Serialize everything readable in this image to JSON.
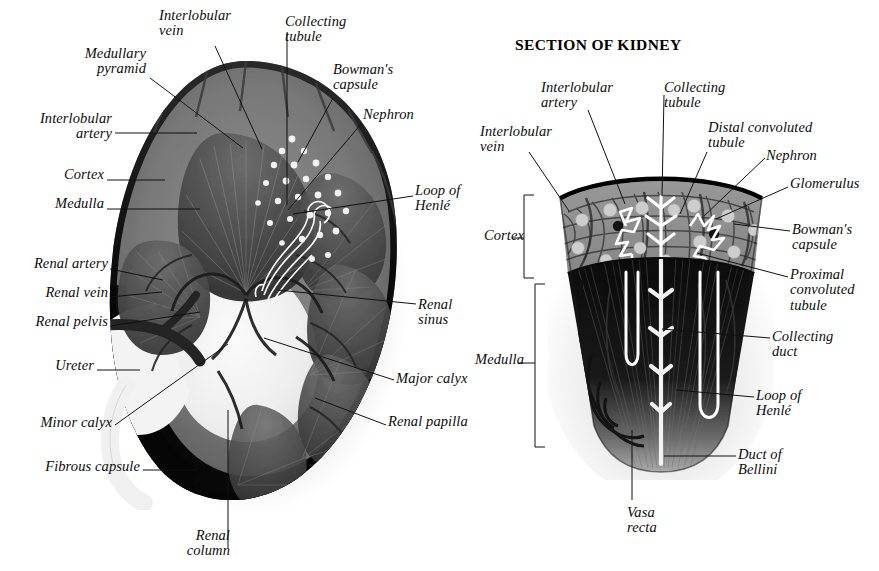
{
  "page": {
    "background": "#ffffff",
    "ink": "#0b0b0b"
  },
  "left_figure": {
    "name": "coronal-section-of-whole-kidney",
    "labels": [
      {
        "id": "medullary-pyramid",
        "text": "Medullary\npyramid",
        "align": "right"
      },
      {
        "id": "interlobular-vein",
        "text": "Interlobular\nvein",
        "align": "left"
      },
      {
        "id": "collecting-tubule",
        "text": "Collecting\ntubule",
        "align": "left"
      },
      {
        "id": "bowmans-capsule",
        "text": "Bowman's\ncapsule",
        "align": "left"
      },
      {
        "id": "interlobular-artery",
        "text": "Interlobular\nartery",
        "align": "left"
      },
      {
        "id": "nephron",
        "text": "Nephron",
        "align": "left"
      },
      {
        "id": "cortex",
        "text": "Cortex",
        "align": "right"
      },
      {
        "id": "medulla",
        "text": "Medulla",
        "align": "right"
      },
      {
        "id": "loop-of-henle",
        "text": "Loop of\nHenlé",
        "align": "left"
      },
      {
        "id": "renal-artery",
        "text": "Renal artery",
        "align": "right"
      },
      {
        "id": "renal-vein",
        "text": "Renal vein",
        "align": "right"
      },
      {
        "id": "renal-pelvis",
        "text": "Renal pelvis",
        "align": "right"
      },
      {
        "id": "renal-sinus",
        "text": "Renal\nsinus",
        "align": "left"
      },
      {
        "id": "ureter",
        "text": "Ureter",
        "align": "right"
      },
      {
        "id": "major-calyx",
        "text": "Major calyx",
        "align": "left"
      },
      {
        "id": "minor-calyx",
        "text": "Minor calyx",
        "align": "right"
      },
      {
        "id": "renal-papilla",
        "text": "Renal papilla",
        "align": "left"
      },
      {
        "id": "fibrous-capsule",
        "text": "Fibrous capsule",
        "align": "right"
      },
      {
        "id": "renal-column",
        "text": "Renal\ncolumn",
        "align": "right"
      }
    ]
  },
  "right_figure": {
    "name": "section-of-kidney-wedge-detail",
    "title": "SECTION OF KIDNEY",
    "labels": [
      {
        "id": "interlobular-artery",
        "text": "Interlobular\nartery",
        "align": "left"
      },
      {
        "id": "collecting-tubule",
        "text": "Collecting\ntubule",
        "align": "left"
      },
      {
        "id": "interlobular-vein",
        "text": "Interlobular\nvein",
        "align": "left"
      },
      {
        "id": "distal-convoluted-tubule",
        "text": "Distal convoluted\ntubule",
        "align": "left"
      },
      {
        "id": "nephron",
        "text": "Nephron",
        "align": "left"
      },
      {
        "id": "glomerulus",
        "text": "Glomerulus",
        "align": "left"
      },
      {
        "id": "bowmans-capsule",
        "text": "Bowman's\ncapsule",
        "align": "left"
      },
      {
        "id": "proximal-convoluted-tubule",
        "text": "Proximal\nconvoluted\ntubule",
        "align": "left"
      },
      {
        "id": "collecting-duct",
        "text": "Collecting\nduct",
        "align": "left"
      },
      {
        "id": "loop-of-henle",
        "text": "Loop of\nHenlé",
        "align": "left"
      },
      {
        "id": "duct-of-bellini",
        "text": "Duct of\nBellini",
        "align": "left"
      },
      {
        "id": "cortex",
        "text": "Cortex",
        "align": "right"
      },
      {
        "id": "medulla",
        "text": "Medulla",
        "align": "right"
      },
      {
        "id": "vasa-recta",
        "text": "Vasa\nrecta",
        "align": "left"
      }
    ]
  }
}
